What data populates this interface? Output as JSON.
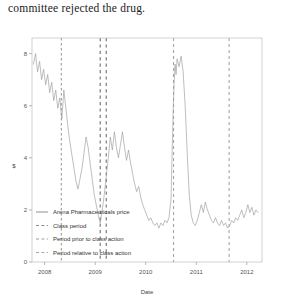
{
  "caption": "committee rejected the drug.",
  "chart_data": {
    "type": "line",
    "title": "",
    "xlabel": "Date",
    "ylabel": "$",
    "xlim": [
      2007.75,
      2012.3
    ],
    "ylim": [
      0,
      8.6
    ],
    "xticks": [
      2008,
      2009,
      2010,
      2011,
      2012
    ],
    "xticklabels": [
      "2008",
      "2009",
      "2010",
      "2011",
      "2012"
    ],
    "yticks": [
      0,
      2,
      4,
      6,
      8
    ],
    "yticklabels": [
      "0",
      "2",
      "4",
      "6",
      "8"
    ],
    "grid": false,
    "legend_position": "bottom-left",
    "legend": [
      {
        "label": "Arena Pharmaceuticals price",
        "style": "solid",
        "color": "#9a9a9a"
      },
      {
        "label": "Class period",
        "style": "dashed",
        "color": "#8d8d8d"
      },
      {
        "label": "Period prior to class action",
        "style": "dashed",
        "color": "#9b9b9b"
      },
      {
        "label": "Period relative to class action",
        "style": "dashed",
        "color": "#a5a5a5"
      }
    ],
    "vlines": [
      {
        "name": "period-prior-start",
        "x": 2008.33,
        "series": "Period prior to class action"
      },
      {
        "name": "class-period-start",
        "x": 2009.1,
        "series": "Class period"
      },
      {
        "name": "class-period-end",
        "x": 2009.22,
        "series": "Class period"
      },
      {
        "name": "event-date",
        "x": 2010.55,
        "series": "Period relative to class action"
      },
      {
        "name": "period-relative-marker",
        "x": 2011.65,
        "series": "Period relative to class action"
      }
    ],
    "series": [
      {
        "name": "Arena Pharmaceuticals price",
        "x": [
          2007.78,
          2007.82,
          2007.86,
          2007.9,
          2007.94,
          2007.98,
          2008.02,
          2008.06,
          2008.1,
          2008.14,
          2008.18,
          2008.22,
          2008.26,
          2008.3,
          2008.34,
          2008.38,
          2008.42,
          2008.46,
          2008.5,
          2008.54,
          2008.58,
          2008.62,
          2008.66,
          2008.7,
          2008.74,
          2008.78,
          2008.82,
          2008.86,
          2008.9,
          2008.94,
          2008.98,
          2009.02,
          2009.06,
          2009.1,
          2009.14,
          2009.18,
          2009.22,
          2009.26,
          2009.3,
          2009.34,
          2009.38,
          2009.42,
          2009.46,
          2009.5,
          2009.54,
          2009.58,
          2009.62,
          2009.66,
          2009.7,
          2009.74,
          2009.78,
          2009.82,
          2009.86,
          2009.9,
          2009.94,
          2009.98,
          2010.02,
          2010.06,
          2010.1,
          2010.14,
          2010.18,
          2010.22,
          2010.26,
          2010.3,
          2010.34,
          2010.38,
          2010.42,
          2010.46,
          2010.5,
          2010.52,
          2010.54,
          2010.56,
          2010.58,
          2010.6,
          2010.62,
          2010.66,
          2010.7,
          2010.74,
          2010.78,
          2010.82,
          2010.86,
          2010.9,
          2010.94,
          2010.98,
          2011.02,
          2011.06,
          2011.1,
          2011.14,
          2011.18,
          2011.22,
          2011.26,
          2011.3,
          2011.34,
          2011.38,
          2011.42,
          2011.46,
          2011.5,
          2011.54,
          2011.58,
          2011.62,
          2011.66,
          2011.7,
          2011.74,
          2011.78,
          2011.82,
          2011.86,
          2011.9,
          2011.94,
          2011.98,
          2012.02,
          2012.06,
          2012.1,
          2012.14,
          2012.18,
          2012.22
        ],
        "y": [
          7.6,
          8.0,
          7.3,
          7.7,
          7.0,
          7.4,
          6.8,
          7.2,
          6.5,
          6.9,
          6.2,
          6.6,
          5.9,
          6.3,
          5.5,
          6.6,
          5.9,
          5.2,
          4.6,
          4.1,
          3.6,
          3.1,
          2.8,
          3.2,
          3.6,
          4.2,
          4.8,
          4.4,
          3.8,
          3.2,
          2.6,
          2.2,
          1.8,
          1.5,
          2.0,
          2.6,
          3.3,
          4.0,
          4.8,
          4.3,
          5.0,
          4.4,
          4.0,
          4.5,
          5.0,
          4.4,
          3.9,
          4.3,
          3.8,
          3.4,
          3.0,
          2.7,
          2.9,
          2.5,
          2.2,
          2.0,
          1.8,
          1.6,
          1.7,
          1.5,
          1.4,
          1.5,
          1.3,
          1.5,
          1.4,
          1.6,
          1.5,
          1.7,
          2.4,
          4.0,
          5.6,
          6.8,
          7.6,
          7.2,
          7.8,
          7.5,
          7.9,
          7.3,
          6.0,
          4.2,
          2.6,
          1.8,
          1.5,
          1.4,
          1.6,
          1.9,
          2.2,
          1.9,
          2.3,
          2.0,
          1.8,
          1.6,
          1.5,
          1.7,
          1.5,
          1.4,
          1.6,
          1.4,
          1.5,
          1.3,
          1.4,
          1.6,
          1.5,
          1.7,
          1.6,
          1.8,
          2.0,
          1.7,
          1.9,
          2.2,
          1.9,
          2.1,
          1.8,
          2.0,
          1.9
        ]
      }
    ]
  }
}
